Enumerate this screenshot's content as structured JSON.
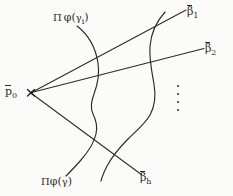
{
  "figure": {
    "kind": "hand-drawn-mathematical-diagram",
    "background_color": "#fbfbfa",
    "ink_color": "#2b2b2b",
    "width": 233,
    "height": 196,
    "labels": {
      "apex": {
        "base": "p",
        "subscript": "0",
        "overbar": true,
        "text": "p̄0"
      },
      "ray_1": {
        "base": "β",
        "subscript": "1",
        "overbar": true,
        "text": "β̄1"
      },
      "ray_2": {
        "base": "β",
        "subscript": "2",
        "overbar": true,
        "text": "β̄2"
      },
      "ray_h": {
        "base": "β",
        "subscript": "h",
        "overbar": true,
        "text": "β̄h"
      },
      "curve_upper": {
        "pi": "Π",
        "phi": "φ",
        "open_paren": "(",
        "gamma": "γ",
        "subscript": "i",
        "close_paren": ")",
        "text": "Πφ(γi)"
      },
      "curve_lower": {
        "pi": "Π",
        "phi": "φ",
        "open_paren": "(",
        "gamma": "γ",
        "subscript": "",
        "close_paren": ")",
        "text": "Πφ(γ)"
      }
    },
    "ellipsis": {
      "orientation": "vertical",
      "dot_count": 4,
      "meaning": "continuation between ray 2 and ray h"
    },
    "rays": [
      {
        "name": "ray-beta-1",
        "from": "apex",
        "to": "beta-1"
      },
      {
        "name": "ray-beta-2",
        "from": "apex",
        "to": "beta-2"
      },
      {
        "name": "ray-beta-h",
        "from": "apex",
        "to": "beta-h"
      }
    ],
    "curves": [
      {
        "name": "curve-pi-phi-gamma-i",
        "shape": "wavy-vertical-left"
      },
      {
        "name": "curve-pi-phi-gamma",
        "shape": "wavy-vertical-right"
      }
    ]
  }
}
